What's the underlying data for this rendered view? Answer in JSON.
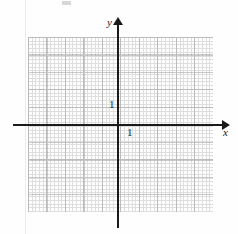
{
  "figure": {
    "kind": "cartesian-coordinate-grid",
    "title": "",
    "axes": {
      "x_label": "x",
      "y_label": "y",
      "x_tick_label": "1",
      "y_tick_label": "1",
      "arrow_x_name": "x-axis-arrowhead",
      "arrow_y_name": "y-axis-arrowhead"
    },
    "colors": {
      "axis": "#1a1a1a",
      "grid_major": "#9a9a9a",
      "grid_minor": "#c4c4c4",
      "background": "#fefefe",
      "page_edge": "#ebebeb"
    },
    "grid": {
      "major_cells_x": 10,
      "major_cells_y": 10,
      "minor_per_major": 5,
      "dotted": true
    },
    "plot_area": {
      "origin_x": 118,
      "origin_y": 125,
      "unit_px_x": 18.5,
      "unit_px_y": 17.5,
      "x_range": [
        -5,
        5
      ],
      "y_range": [
        -5,
        5
      ]
    },
    "data_curves": []
  }
}
